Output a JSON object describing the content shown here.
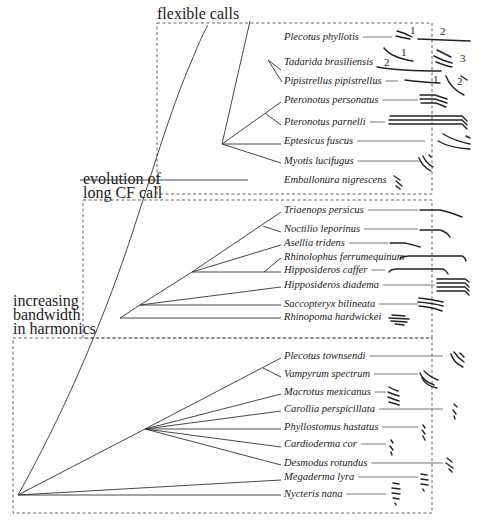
{
  "groups": [
    {
      "id": "flexible",
      "label_lines": [
        "flexible calls"
      ],
      "box": {
        "x": 157,
        "y": 23,
        "w": 275,
        "h": 171
      },
      "label_pos": {
        "x": 157,
        "y": 19
      }
    },
    {
      "id": "long_cf",
      "label_lines": [
        "evolution of",
        "long CF call"
      ],
      "box": {
        "x": 83,
        "y": 200,
        "w": 349,
        "h": 138
      },
      "label_pos": {
        "x": 83,
        "y": 184
      }
    },
    {
      "id": "bandwidth",
      "label_lines": [
        "increasing",
        "bandwidth",
        "in harmonics"
      ],
      "box": {
        "x": 13,
        "y": 338,
        "w": 419,
        "h": 175
      },
      "label_pos": {
        "x": 13,
        "y": 306
      }
    }
  ],
  "species": [
    {
      "name": "Plecotus phyllotis",
      "y": 37,
      "lead_end": 392
    },
    {
      "name": "Tadarida brasiliensis",
      "y": 62,
      "lead_end": 370
    },
    {
      "name": "Pipistrellus pipistrellus",
      "y": 81,
      "lead_end": 398
    },
    {
      "name": "Pteronotus  personatus",
      "y": 100,
      "lead_end": 418
    },
    {
      "name": "Pteronotus parnelli",
      "y": 122,
      "lead_end": 385
    },
    {
      "name": "Eptesicus fuscus",
      "y": 141,
      "lead_end": 425
    },
    {
      "name": "Myotis lucifugus",
      "y": 161,
      "lead_end": 420
    },
    {
      "name": "Emballonura nigrescens",
      "y": 180,
      "lead_end": 390
    },
    {
      "name": "Triaenops persicus",
      "y": 210,
      "lead_end": 418
    },
    {
      "name": "Noctilio leporinus",
      "y": 229,
      "lead_end": 418
    },
    {
      "name": "Asellia tridens",
      "y": 243,
      "lead_end": 388
    },
    {
      "name": "Rhinolophus ferrumequinum",
      "y": 257,
      "lead_end": 395
    },
    {
      "name": "Hipposideros caffer",
      "y": 270,
      "lead_end": 385
    },
    {
      "name": "Hipposideros diadema",
      "y": 285,
      "lead_end": 435
    },
    {
      "name": "Saccopteryx bilineata",
      "y": 304,
      "lead_end": 418
    },
    {
      "name": "Rhinopoma hardwickei",
      "y": 317,
      "lead_end": 385
    },
    {
      "name": "Plecotus townsendi",
      "y": 356,
      "lead_end": 443
    },
    {
      "name": "Vampyrum spectrum",
      "y": 374,
      "lead_end": 418
    },
    {
      "name": "Macrotus mexicanus",
      "y": 392,
      "lead_end": 386
    },
    {
      "name": "Carollia perspicillata",
      "y": 409,
      "lead_end": 443
    },
    {
      "name": "Phyllostomus hastatus",
      "y": 427,
      "lead_end": 418
    },
    {
      "name": "Cardioderma cor",
      "y": 444,
      "lead_end": 386
    },
    {
      "name": "Desmodus rotundus",
      "y": 463,
      "lead_end": 443
    },
    {
      "name": "Megaderma lyra",
      "y": 477,
      "lead_end": 418
    },
    {
      "name": "Nycteris nana",
      "y": 494,
      "lead_end": 386
    }
  ],
  "harmonic_numbers": [
    {
      "text": "1",
      "x": 410,
      "y": 34
    },
    {
      "text": "2",
      "x": 440,
      "y": 35
    },
    {
      "text": "1",
      "x": 401,
      "y": 56
    },
    {
      "text": "3",
      "x": 460,
      "y": 62
    },
    {
      "text": "2",
      "x": 384,
      "y": 66
    },
    {
      "text": "1",
      "x": 433,
      "y": 83
    },
    {
      "text": "2",
      "x": 457,
      "y": 85
    }
  ],
  "colors": {
    "ink": "#222222",
    "box": "#555555",
    "lead": "#666666",
    "background": "#ffffff"
  }
}
